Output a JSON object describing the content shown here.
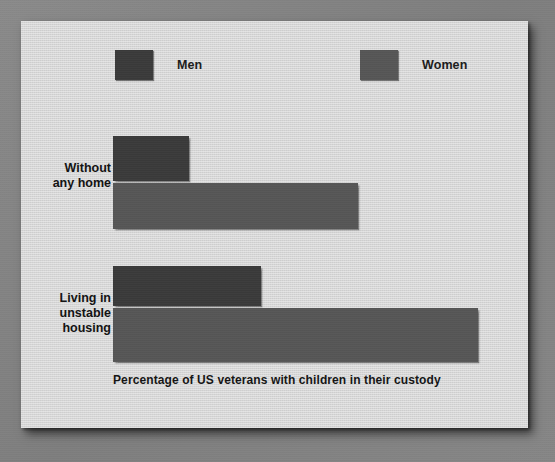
{
  "chart_data": {
    "type": "bar",
    "orientation": "horizontal",
    "title": "",
    "caption": "Percentage of US veterans with children in their custody",
    "xlabel": "Percentage of US veterans with children in their custody",
    "ylabel": "",
    "grid": false,
    "legend_position": "top",
    "xlim": [
      0,
      100
    ],
    "axis_baseline_px": 113,
    "categories": [
      "Without any home",
      "Living in unstable housing"
    ],
    "category_lines": [
      [
        "Without",
        "any home"
      ],
      [
        "Living in",
        "unstable",
        "housing"
      ]
    ],
    "series": [
      {
        "name": "Men",
        "color": "#3a3a3a",
        "values": [
          19,
          37
        ],
        "bar_pixel_lengths": [
          76,
          148
        ]
      },
      {
        "name": "Women",
        "color": "#565656",
        "values": [
          61,
          91
        ],
        "bar_pixel_lengths": [
          245,
          365
        ]
      }
    ]
  },
  "legend": {
    "entries": [
      {
        "label": "Men",
        "color": "#3a3a3a"
      },
      {
        "label": "Women",
        "color": "#565656"
      }
    ]
  },
  "colors": {
    "card_background": "#dddddd",
    "page_background": "#848484",
    "men_bar": "#3a3a3a",
    "women_bar": "#565656",
    "text": "#141414"
  }
}
